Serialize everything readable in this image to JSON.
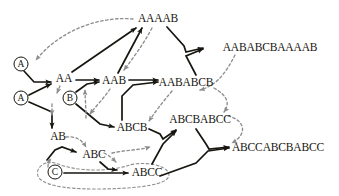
{
  "diagram": {
    "colors": {
      "solid_edge": "#17150f",
      "dotted_edge": "#8d8d8d",
      "text": "#17150f",
      "background": "#ffffff"
    },
    "terminal_nodes": [
      {
        "id": "t_a1",
        "label": "A",
        "x": 21,
        "y": 64
      },
      {
        "id": "t_a2",
        "label": "A",
        "x": 21,
        "y": 98
      },
      {
        "id": "t_b",
        "label": "B",
        "x": 70,
        "y": 98
      },
      {
        "id": "t_c",
        "label": "C",
        "x": 55,
        "y": 172
      }
    ],
    "string_nodes": [
      {
        "id": "s_aa",
        "label": "AA",
        "x": 64,
        "y": 79
      },
      {
        "id": "s_aab",
        "label": "AAB",
        "x": 114,
        "y": 81
      },
      {
        "id": "s_ab",
        "label": "AB",
        "x": 58,
        "y": 137
      },
      {
        "id": "s_abc",
        "label": "ABC",
        "x": 94,
        "y": 155
      },
      {
        "id": "s_abcb",
        "label": "ABCB",
        "x": 132,
        "y": 128
      },
      {
        "id": "s_abcc",
        "label": "ABCC",
        "x": 147,
        "y": 173
      },
      {
        "id": "s_aaaab",
        "label": "AAAAB",
        "x": 158,
        "y": 19
      },
      {
        "id": "s_aababcb",
        "label": "AABABCB",
        "x": 186,
        "y": 83
      },
      {
        "id": "s_abcbabcc",
        "label": "ABCBABCC",
        "x": 200,
        "y": 120
      },
      {
        "id": "s_aababcbaaaab",
        "label": "AABABCBAAAAB",
        "x": 270,
        "y": 48
      },
      {
        "id": "s_abccabcbabcc",
        "label": "ABCCABCBABCC",
        "x": 278,
        "y": 148
      }
    ],
    "solid_edges": [
      {
        "from": "t_a1",
        "to": "s_aa"
      },
      {
        "from": "t_a2",
        "to": "s_aa"
      },
      {
        "from": "t_a2",
        "to": "s_ab"
      },
      {
        "from": "t_b",
        "to": "s_aab"
      },
      {
        "from": "t_b",
        "to": "s_abcb"
      },
      {
        "from": "t_c",
        "to": "s_abc"
      },
      {
        "from": "t_c",
        "to": "s_abcc"
      },
      {
        "from": "s_aa",
        "to": "s_aab"
      },
      {
        "from": "s_aa",
        "to": "s_aaaab"
      },
      {
        "from": "s_aab",
        "to": "s_aaaab"
      },
      {
        "from": "s_aab",
        "to": "s_aababcb"
      },
      {
        "from": "s_abcb",
        "to": "s_aababcb"
      },
      {
        "from": "s_abc",
        "to": "s_abcc"
      },
      {
        "from": "s_aaaab",
        "to": "s_aababcbaaaab"
      },
      {
        "from": "s_aababcb",
        "to": "s_aababcbaaaab"
      },
      {
        "from": "s_abcb",
        "to": "s_abcbabcc"
      },
      {
        "from": "s_abcc",
        "to": "s_abcbabcc"
      },
      {
        "from": "s_abcbabcc",
        "to": "s_abccabcbabcc"
      },
      {
        "from": "s_abcc",
        "to": "s_abccabcbabcc"
      }
    ],
    "dotted_edges": [
      {
        "from": "s_aaaab",
        "to": "t_a1"
      },
      {
        "from": "s_aa",
        "to": "t_b"
      },
      {
        "from": "s_aab",
        "to": "t_b"
      },
      {
        "from": "s_aaaab",
        "to": "s_aab"
      },
      {
        "from": "s_aababcb",
        "to": "s_abcb"
      },
      {
        "from": "s_ab",
        "to": "s_abc"
      },
      {
        "from": "s_abc",
        "to": "s_abcc"
      },
      {
        "from": "s_aababcbaaaab",
        "to": "s_aababcb"
      },
      {
        "from": "s_abcbabcc",
        "to": "s_abcc"
      },
      {
        "from": "s_abccabcbabcc",
        "to": "s_abcbabcc"
      }
    ],
    "enclosure": {
      "id": "group-c-abcc",
      "label": "dotted-group"
    }
  }
}
